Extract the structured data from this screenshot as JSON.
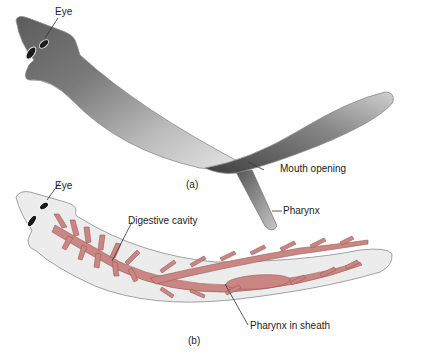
{
  "figure": {
    "panels": [
      {
        "id": "a",
        "caption": "(a)",
        "subject": "Planarian external view",
        "labels": {
          "eye": "Eye",
          "mouth": "Mouth opening",
          "pharynx": "Pharynx"
        }
      },
      {
        "id": "b",
        "caption": "(b)",
        "subject": "Planarian internal digestive system",
        "labels": {
          "eye": "Eye",
          "digestive": "Digestive cavity",
          "pharynx_sheath": "Pharynx in sheath"
        }
      }
    ],
    "colors": {
      "body_outline": "#8a8a8a",
      "body_fill_b": "#ececec",
      "body_shade_a": "#6e6e6e",
      "digestive": "#c98683",
      "digestive_edge": "#9c5a57",
      "leader": "#333333"
    }
  }
}
